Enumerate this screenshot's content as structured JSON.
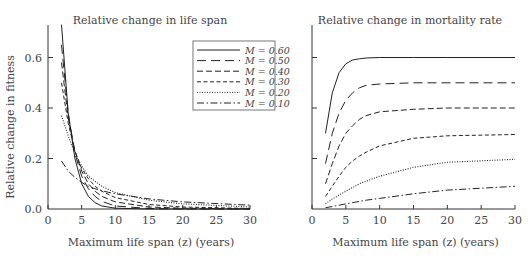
{
  "chart_data": [
    {
      "type": "line",
      "title": "Relative change in life span",
      "xlabel": "Maximum life span (z) (years)",
      "ylabel": "Relative change in fitness",
      "xlim": [
        0,
        30
      ],
      "ylim": [
        0,
        0.72
      ],
      "xticks": [
        0,
        5,
        10,
        15,
        20,
        25,
        30
      ],
      "yticks": [
        "0.0",
        "0.2",
        "0.4",
        "0.6"
      ],
      "legend_position": "upper right",
      "grid": false,
      "series": [
        {
          "name": "M = 0.60",
          "style": "solid",
          "x": [
            2,
            3,
            4,
            5,
            6,
            7,
            8,
            10,
            15,
            20,
            30
          ],
          "values": [
            0.73,
            0.38,
            0.2,
            0.1,
            0.05,
            0.025,
            0.012,
            0.003,
            0.0,
            0.0,
            0.0
          ]
        },
        {
          "name": "M = 0.50",
          "style": "longdash",
          "x": [
            2,
            3,
            4,
            5,
            6,
            7,
            8,
            10,
            15,
            20,
            30
          ],
          "values": [
            0.65,
            0.38,
            0.22,
            0.13,
            0.08,
            0.05,
            0.03,
            0.012,
            0.002,
            0.0,
            0.0
          ]
        },
        {
          "name": "M = 0.40",
          "style": "dash",
          "x": [
            2,
            3,
            4,
            5,
            6,
            7,
            8,
            10,
            15,
            20,
            30
          ],
          "values": [
            0.58,
            0.36,
            0.23,
            0.15,
            0.1,
            0.07,
            0.05,
            0.028,
            0.008,
            0.003,
            0.0
          ]
        },
        {
          "name": "M = 0.30",
          "style": "shortdash",
          "x": [
            2,
            3,
            4,
            5,
            6,
            7,
            8,
            10,
            15,
            20,
            30
          ],
          "values": [
            0.5,
            0.34,
            0.23,
            0.16,
            0.12,
            0.09,
            0.07,
            0.045,
            0.018,
            0.008,
            0.002
          ]
        },
        {
          "name": "M = 0.20",
          "style": "dotted",
          "x": [
            2,
            3,
            4,
            5,
            6,
            7,
            8,
            10,
            15,
            20,
            30
          ],
          "values": [
            0.37,
            0.29,
            0.22,
            0.17,
            0.13,
            0.11,
            0.09,
            0.065,
            0.035,
            0.02,
            0.008
          ]
        },
        {
          "name": "M = 0.10",
          "style": "dashdot",
          "x": [
            2,
            3,
            4,
            5,
            6,
            7,
            8,
            10,
            15,
            20,
            30
          ],
          "values": [
            0.19,
            0.15,
            0.125,
            0.105,
            0.09,
            0.08,
            0.072,
            0.06,
            0.04,
            0.028,
            0.015
          ]
        }
      ]
    },
    {
      "type": "line",
      "title": "Relative change in mortality rate",
      "xlabel": "Maximum life span (z) (years)",
      "ylabel": "",
      "xlim": [
        0,
        30
      ],
      "ylim": [
        0,
        0.72
      ],
      "xticks": [
        0,
        5,
        10,
        15,
        20,
        25,
        30
      ],
      "yticks": [],
      "grid": false,
      "series": [
        {
          "name": "M = 0.60",
          "style": "solid",
          "x": [
            2,
            3,
            4,
            5,
            6,
            7,
            8,
            10,
            15,
            20,
            30
          ],
          "values": [
            0.3,
            0.46,
            0.54,
            0.575,
            0.59,
            0.595,
            0.598,
            0.6,
            0.6,
            0.6,
            0.6
          ]
        },
        {
          "name": "M = 0.50",
          "style": "longdash",
          "x": [
            2,
            3,
            4,
            5,
            6,
            7,
            8,
            10,
            15,
            20,
            30
          ],
          "values": [
            0.18,
            0.3,
            0.38,
            0.43,
            0.46,
            0.48,
            0.49,
            0.495,
            0.5,
            0.5,
            0.5
          ]
        },
        {
          "name": "M = 0.40",
          "style": "dash",
          "x": [
            2,
            3,
            4,
            5,
            6,
            7,
            8,
            10,
            15,
            20,
            30
          ],
          "values": [
            0.1,
            0.18,
            0.25,
            0.3,
            0.33,
            0.355,
            0.37,
            0.385,
            0.395,
            0.4,
            0.4
          ]
        },
        {
          "name": "M = 0.30",
          "style": "shortdash",
          "x": [
            2,
            3,
            4,
            5,
            6,
            7,
            8,
            10,
            15,
            20,
            30
          ],
          "values": [
            0.05,
            0.09,
            0.13,
            0.165,
            0.19,
            0.21,
            0.225,
            0.25,
            0.28,
            0.29,
            0.295
          ]
        },
        {
          "name": "M = 0.20",
          "style": "dotted",
          "x": [
            2,
            3,
            4,
            5,
            6,
            7,
            8,
            10,
            15,
            20,
            30
          ],
          "values": [
            0.02,
            0.04,
            0.055,
            0.07,
            0.085,
            0.1,
            0.11,
            0.13,
            0.165,
            0.185,
            0.197
          ]
        },
        {
          "name": "M = 0.10",
          "style": "dashdot",
          "x": [
            2,
            3,
            4,
            5,
            6,
            7,
            8,
            10,
            15,
            20,
            30
          ],
          "values": [
            0.005,
            0.01,
            0.015,
            0.02,
            0.025,
            0.03,
            0.035,
            0.042,
            0.06,
            0.075,
            0.09
          ]
        }
      ]
    }
  ]
}
